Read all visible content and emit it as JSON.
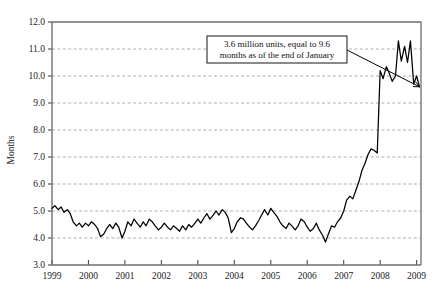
{
  "chart_data": {
    "type": "line",
    "title": "",
    "xlabel": "",
    "ylabel": "Months",
    "ylim": [
      3.0,
      12.0
    ],
    "xlim": [
      1999.0,
      2009.12
    ],
    "grid": true,
    "legend": null,
    "ytick_labels": [
      "3.0",
      "4.0",
      "5.0",
      "6.0",
      "7.0",
      "8.0",
      "9.0",
      "10.0",
      "11.0",
      "12.0"
    ],
    "ytick_values": [
      3.0,
      4.0,
      5.0,
      6.0,
      7.0,
      8.0,
      9.0,
      10.0,
      11.0,
      12.0
    ],
    "xtick_labels": [
      "1999",
      "2000",
      "2001",
      "2002",
      "2003",
      "2004",
      "2005",
      "2006",
      "2007",
      "2008",
      "2009"
    ],
    "xtick_values": [
      1999,
      2000,
      2001,
      2002,
      2003,
      2004,
      2005,
      2006,
      2007,
      2008,
      2009
    ],
    "series": [
      {
        "name": "Months supply of existing homes",
        "color": "#000000",
        "x": [
          1999.0,
          1999.08,
          1999.17,
          1999.25,
          1999.33,
          1999.42,
          1999.5,
          1999.58,
          1999.67,
          1999.75,
          1999.83,
          1999.92,
          2000.0,
          2000.08,
          2000.17,
          2000.25,
          2000.33,
          2000.42,
          2000.5,
          2000.58,
          2000.67,
          2000.75,
          2000.83,
          2000.92,
          2001.0,
          2001.08,
          2001.17,
          2001.25,
          2001.33,
          2001.42,
          2001.5,
          2001.58,
          2001.67,
          2001.75,
          2001.83,
          2001.92,
          2002.0,
          2002.08,
          2002.17,
          2002.25,
          2002.33,
          2002.42,
          2002.5,
          2002.58,
          2002.67,
          2002.75,
          2002.83,
          2002.92,
          2003.0,
          2003.08,
          2003.17,
          2003.25,
          2003.33,
          2003.42,
          2003.5,
          2003.58,
          2003.67,
          2003.75,
          2003.83,
          2003.92,
          2004.0,
          2004.08,
          2004.17,
          2004.25,
          2004.33,
          2004.42,
          2004.5,
          2004.58,
          2004.67,
          2004.75,
          2004.83,
          2004.92,
          2005.0,
          2005.08,
          2005.17,
          2005.25,
          2005.33,
          2005.42,
          2005.5,
          2005.58,
          2005.67,
          2005.75,
          2005.83,
          2005.92,
          2006.0,
          2006.08,
          2006.17,
          2006.25,
          2006.33,
          2006.42,
          2006.5,
          2006.58,
          2006.67,
          2006.75,
          2006.83,
          2006.92,
          2007.0,
          2007.08,
          2007.17,
          2007.25,
          2007.33,
          2007.42,
          2007.5,
          2007.58,
          2007.67,
          2007.75,
          2007.83,
          2007.92,
          2008.0,
          2008.08,
          2008.17,
          2008.25,
          2008.33,
          2008.42,
          2008.5,
          2008.58,
          2008.67,
          2008.75,
          2008.83,
          2008.92,
          2009.0,
          2009.08
        ],
        "y": [
          5.1,
          5.2,
          5.05,
          5.15,
          4.95,
          5.05,
          4.9,
          4.6,
          4.45,
          4.55,
          4.4,
          4.55,
          4.45,
          4.6,
          4.5,
          4.35,
          4.05,
          4.15,
          4.35,
          4.5,
          4.35,
          4.55,
          4.4,
          4.0,
          4.25,
          4.6,
          4.45,
          4.7,
          4.55,
          4.4,
          4.6,
          4.45,
          4.7,
          4.6,
          4.45,
          4.3,
          4.4,
          4.55,
          4.4,
          4.3,
          4.45,
          4.35,
          4.25,
          4.45,
          4.3,
          4.5,
          4.4,
          4.55,
          4.7,
          4.55,
          4.75,
          4.9,
          4.7,
          4.85,
          5.0,
          4.85,
          5.05,
          4.95,
          4.75,
          4.2,
          4.35,
          4.6,
          4.75,
          4.7,
          4.55,
          4.4,
          4.3,
          4.45,
          4.65,
          4.85,
          5.05,
          4.85,
          5.1,
          4.95,
          4.8,
          4.6,
          4.45,
          4.35,
          4.55,
          4.45,
          4.3,
          4.45,
          4.7,
          4.6,
          4.4,
          4.25,
          4.35,
          4.55,
          4.3,
          4.1,
          3.85,
          4.15,
          4.45,
          4.4,
          4.6,
          4.75,
          5.0,
          5.4,
          5.55,
          5.45,
          5.75,
          6.1,
          6.5,
          6.75,
          7.1,
          7.3,
          7.25,
          7.15,
          7.3,
          7.2,
          7.05,
          6.8,
          7.0,
          7.6,
          8.4,
          9.3,
          9.85,
          10.3,
          10.45,
          10.2,
          10.15,
          9.9
        ]
      }
    ],
    "secondary_points": {
      "comment": "2008-2009 oscillation detail",
      "x": [
        2008.0,
        2008.08,
        2008.17,
        2008.25,
        2008.33,
        2008.42,
        2008.5,
        2008.58,
        2008.67,
        2008.75,
        2008.83,
        2008.92,
        2009.0,
        2009.08
      ],
      "y": [
        10.2,
        9.9,
        10.35,
        10.1,
        9.8,
        10.0,
        11.3,
        10.55,
        11.1,
        10.5,
        11.3,
        9.7,
        10.0,
        9.6
      ]
    },
    "annotations": [
      {
        "name": "callout",
        "text_line1": "3.6 million units, equal to 9.6",
        "text_line2": "months as of the end of January",
        "points_to_x": 2009.08,
        "points_to_y": 9.6
      }
    ]
  },
  "axis": {
    "ylabel": "Months"
  }
}
